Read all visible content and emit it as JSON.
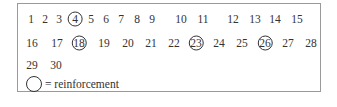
{
  "schedule": {
    "rows": [
      {
        "items": [
          {
            "n": "1",
            "x": 30,
            "circled": false
          },
          {
            "n": "2",
            "x": 44,
            "circled": false
          },
          {
            "n": "3",
            "x": 58,
            "circled": false
          },
          {
            "n": "4",
            "x": 74,
            "circled": true
          },
          {
            "n": "5",
            "x": 90,
            "circled": false
          },
          {
            "n": "6",
            "x": 105,
            "circled": false
          },
          {
            "n": "7",
            "x": 120,
            "circled": false
          },
          {
            "n": "8",
            "x": 136,
            "circled": false
          },
          {
            "n": "9",
            "x": 151,
            "circled": false
          },
          {
            "n": "10",
            "x": 180,
            "circled": false
          },
          {
            "n": "11",
            "x": 202,
            "circled": false
          },
          {
            "n": "12",
            "x": 232,
            "circled": false
          },
          {
            "n": "13",
            "x": 254,
            "circled": false
          },
          {
            "n": "14",
            "x": 274,
            "circled": false
          },
          {
            "n": "15",
            "x": 296,
            "circled": false
          }
        ],
        "y": 18
      },
      {
        "items": [
          {
            "n": "16",
            "x": 31,
            "circled": false
          },
          {
            "n": "17",
            "x": 56,
            "circled": false
          },
          {
            "n": "18",
            "x": 78,
            "circled": true
          },
          {
            "n": "19",
            "x": 103,
            "circled": false
          },
          {
            "n": "20",
            "x": 127,
            "circled": false
          },
          {
            "n": "21",
            "x": 150,
            "circled": false
          },
          {
            "n": "22",
            "x": 173,
            "circled": false
          },
          {
            "n": "23",
            "x": 195,
            "circled": true
          },
          {
            "n": "24",
            "x": 218,
            "circled": false
          },
          {
            "n": "25",
            "x": 241,
            "circled": false
          },
          {
            "n": "26",
            "x": 264,
            "circled": true
          },
          {
            "n": "27",
            "x": 287,
            "circled": false
          },
          {
            "n": "28",
            "x": 310,
            "circled": false
          }
        ],
        "y": 42
      },
      {
        "items": [
          {
            "n": "29",
            "x": 31,
            "circled": false
          },
          {
            "n": "30",
            "x": 55,
            "circled": false
          }
        ],
        "y": 64
      }
    ],
    "legend": {
      "symbol": "circle-icon",
      "label": "= reinforcement"
    },
    "colors": {
      "text": "#333333",
      "border": "#9a9a9a"
    }
  }
}
